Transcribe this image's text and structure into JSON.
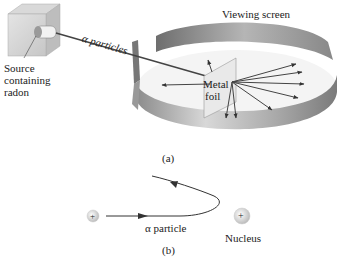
{
  "figure": {
    "part_a": {
      "caption": "(a)",
      "labels": {
        "source": [
          "Source",
          "containing",
          "radon"
        ],
        "beam": "α particles",
        "screen": "Viewing screen",
        "foil": [
          "Metal",
          "foil"
        ]
      }
    },
    "part_b": {
      "caption": "(b)",
      "labels": {
        "particle": "α particle",
        "nucleus": "Nucleus",
        "particle_charge": "+",
        "nucleus_charge": "+"
      }
    }
  }
}
